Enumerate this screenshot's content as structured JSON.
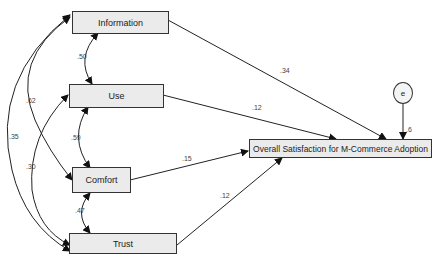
{
  "diagram": {
    "type": "structural-equation-model",
    "nodes": {
      "information": "Information",
      "use": "Use",
      "comfort": "Comfort",
      "trust": "Trust",
      "outcome": "Overall Satisfaction for M-Commerce Adoption",
      "error": "e"
    },
    "covariances": {
      "information_use": ".50",
      "use_comfort": ".59",
      "comfort_trust": ".47",
      "information_comfort": ".62",
      "information_trust": ".35",
      "use_trust": ".30"
    },
    "paths": {
      "information_outcome": ".34",
      "use_outcome": ".12",
      "comfort_outcome": ".15",
      "trust_outcome": ".12",
      "error_outcome": ".6"
    }
  }
}
